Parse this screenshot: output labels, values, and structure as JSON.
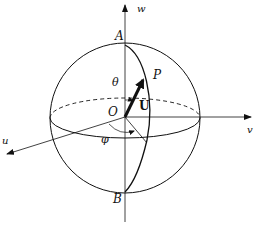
{
  "diagram": {
    "axes": {
      "w": "w",
      "u": "u",
      "v": "v"
    },
    "points": {
      "north_pole": "A",
      "south_pole": "B",
      "origin": "O",
      "point": "P"
    },
    "vector": "U",
    "angles": {
      "polar": "θ",
      "azimuth": "φ"
    },
    "colors": {
      "line": "#111111",
      "background": "#ffffff"
    }
  }
}
